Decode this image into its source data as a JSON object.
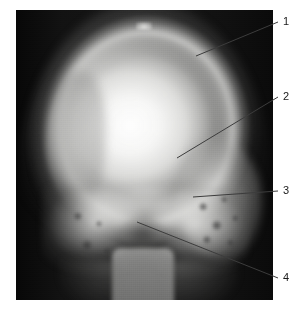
{
  "figure": {
    "type": "radiograph",
    "modality": "X-ray",
    "view": "skull, frontal / Towne projection",
    "plate": {
      "left": 16,
      "top": 10,
      "width": 257,
      "height": 290,
      "background_color": "#101010"
    },
    "colors": {
      "film_dark": "#101010",
      "bone_bright": "#f4f4f2",
      "soft_tissue": "#9a9a98",
      "leader_line": "#3c3c3c",
      "label_text": "#1a1a1a",
      "page_background": "#ffffff"
    }
  },
  "annotations": [
    {
      "id": "1",
      "label": "1",
      "label_x": 283,
      "label_y": 16,
      "leader": {
        "x1": 278,
        "y1": 22,
        "x2": 196,
        "y2": 56
      }
    },
    {
      "id": "2",
      "label": "2",
      "label_x": 283,
      "label_y": 91,
      "leader": {
        "x1": 278,
        "y1": 97,
        "x2": 177,
        "y2": 158
      }
    },
    {
      "id": "3",
      "label": "3",
      "label_x": 283,
      "label_y": 185,
      "leader": {
        "x1": 278,
        "y1": 191,
        "x2": 193,
        "y2": 197
      }
    },
    {
      "id": "4",
      "label": "4",
      "label_x": 283,
      "label_y": 272,
      "leader": {
        "x1": 278,
        "y1": 278,
        "x2": 137,
        "y2": 222
      }
    }
  ]
}
